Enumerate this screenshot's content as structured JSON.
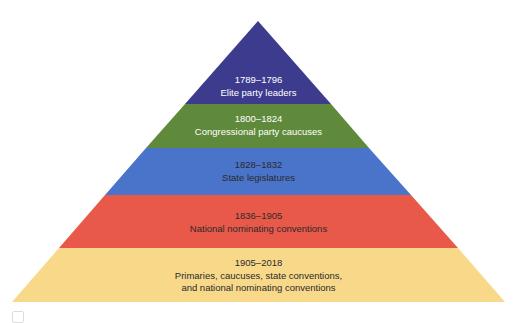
{
  "diagram": {
    "type": "pyramid",
    "orientation": "apex-up",
    "levels": [
      {
        "period": "1789–1796",
        "method": "Elite party leaders",
        "color": "#3d3b8e",
        "text_color": "#ffffff"
      },
      {
        "period": "1800–1824",
        "method": "Congressional party caucuses",
        "color": "#5f8a3b",
        "text_color": "#ffffff"
      },
      {
        "period": "1828–1832",
        "method": "State legislatures",
        "color": "#4a74c9",
        "text_color": "#1f1f1f"
      },
      {
        "period": "1836–1905",
        "method": "National nominating conventions",
        "color": "#e8594a",
        "text_color": "#1f1f1f"
      },
      {
        "period": "1905–2018",
        "method_line1": "Primaries, caucuses, state conventions,",
        "method_line2": "and national nominating conventions",
        "color": "#f8d98a",
        "text_color": "#1f1f1f"
      }
    ]
  }
}
